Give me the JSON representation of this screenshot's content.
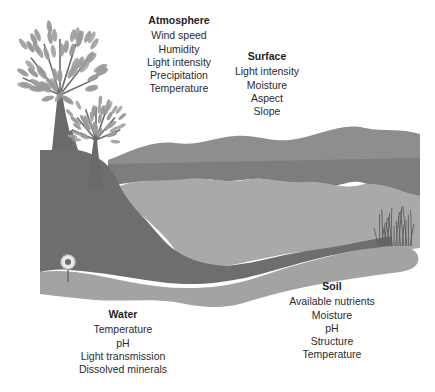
{
  "diagram": {
    "type": "ecosystem-environmental-factors",
    "colors": {
      "background": "#ffffff",
      "hill_far": "#8e8e8e",
      "hill_band": "#7d7d7d",
      "lake": "#a9a9a9",
      "ground_dark": "#6e6e6e",
      "ground_light": "#a3a3a3",
      "foliage": "#9a9a9a",
      "trunk": "#6a6a6a",
      "flower": "#e8e8e8",
      "grass": "#5a5a5a"
    },
    "illustration": {
      "elements": [
        "large-tree",
        "small-tree",
        "hills",
        "lake",
        "soil-ground",
        "flower",
        "grass-tuft"
      ]
    },
    "groups": {
      "atmosphere": {
        "title": "Atmosphere",
        "items": [
          "Wind speed",
          "Humidity",
          "Light intensity",
          "Precipitation",
          "Temperature"
        ]
      },
      "surface": {
        "title": "Surface",
        "items": [
          "Light intensity",
          "Moisture",
          "Aspect",
          "Slope"
        ]
      },
      "water": {
        "title": "Water",
        "items": [
          "Temperature",
          "pH",
          "Light transmission",
          "Dissolved minerals"
        ]
      },
      "soil": {
        "title": "Soil",
        "items": [
          "Available nutrients",
          "Moisture",
          "pH",
          "Structure",
          "Temperature"
        ]
      }
    }
  }
}
